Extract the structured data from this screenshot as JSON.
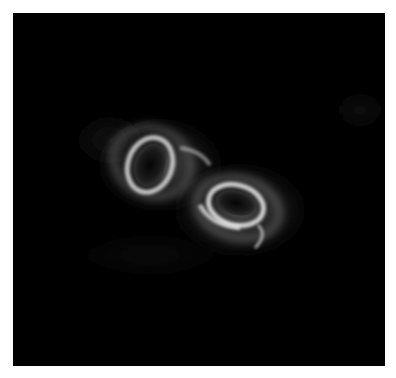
{
  "image": {
    "description": "Visualization of two glowing swirling vortices on black background",
    "background_color": "#000000",
    "border_color": "#ffffff",
    "glow_color": "#e8e8e8",
    "vortices": [
      {
        "name": "upper-left-vortex",
        "cx": 150,
        "cy": 165,
        "rx": 18,
        "ry": 25,
        "rotate": 20
      },
      {
        "name": "lower-right-vortex",
        "cx": 237,
        "cy": 204,
        "rx": 23,
        "ry": 14,
        "rotate": 15
      }
    ]
  }
}
